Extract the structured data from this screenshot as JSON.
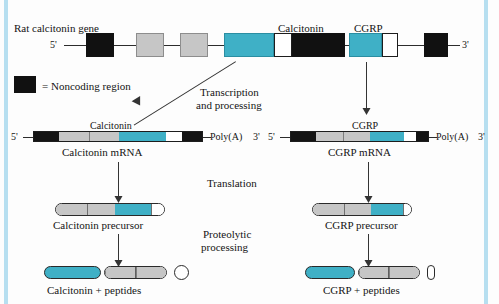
{
  "diagram": {
    "colors": {
      "teal": "#3fb0c6",
      "gray": "#c6c6c6",
      "black": "#141414",
      "white": "#ffffff",
      "frame_blue": "#b7dff0"
    },
    "gene_row": {
      "label": "Rat calcitonin gene",
      "five_prime": "5'",
      "three_prime": "3'",
      "exon_labels": {
        "calcitonin": "Calcitonin",
        "cgrp": "CGRP"
      }
    },
    "legend": {
      "text": "= Noncoding region"
    },
    "steps": {
      "transcription_line1": "Transcription",
      "transcription_line2": "and processing",
      "translation": "Translation",
      "proteolytic_line1": "Proteolytic",
      "proteolytic_line2": "processing"
    },
    "mrna_left": {
      "exon_label": "Calcitonin",
      "five_prime": "5'",
      "poly_a": "Poly(A)",
      "three_prime": "3'",
      "name": "Calcitonin mRNA"
    },
    "mrna_right": {
      "exon_label": "CGRP",
      "five_prime": "5'",
      "poly_a": "Poly(A)",
      "three_prime": "3'",
      "name": "CGRP mRNA"
    },
    "precursor_left": {
      "name": "Calcitonin precursor"
    },
    "precursor_right": {
      "name": "CGRP precursor"
    },
    "product_left": {
      "name": "Calcitonin + peptides"
    },
    "product_right": {
      "name": "CGRP + peptides"
    }
  }
}
